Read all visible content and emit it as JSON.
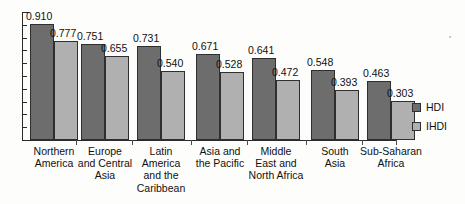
{
  "chart_data": {
    "type": "bar",
    "title": "",
    "xlabel": "",
    "ylabel": "",
    "ylim": [
      0,
      1.0
    ],
    "grid": false,
    "legend_position": "right",
    "categories": [
      "Northern\nAmerica",
      "Europe\nand Central\nAsia",
      "Latin\nAmerica\nand the\nCaribbean",
      "Asia and\nthe Pacific",
      "Middle\nEast and\nNorth Africa",
      "South\nAsia",
      "Sub-Saharan\nAfrica"
    ],
    "series": [
      {
        "name": "HDI",
        "color": "#6d6d6d",
        "values": [
          0.91,
          0.751,
          0.731,
          0.671,
          0.641,
          0.548,
          0.463
        ],
        "labels": [
          "0.910",
          "0.751",
          "0.731",
          "0.671",
          "0.641",
          "0.548",
          "0.463"
        ]
      },
      {
        "name": "IHDI",
        "color": "#b0b0b0",
        "values": [
          0.777,
          0.655,
          0.54,
          0.528,
          0.472,
          0.393,
          0.303
        ],
        "labels": [
          "0.777",
          "0.655",
          "0.540",
          "0.528",
          "0.472",
          "0.393",
          "0.303"
        ]
      }
    ],
    "y_axis_tick_count": 10,
    "y_axis_tick_labels": []
  },
  "legend": {
    "items": [
      {
        "label": "HDI",
        "swatch": "dark-gray-swatch-icon"
      },
      {
        "label": "IHDI",
        "swatch": "light-gray-swatch-icon"
      }
    ]
  }
}
